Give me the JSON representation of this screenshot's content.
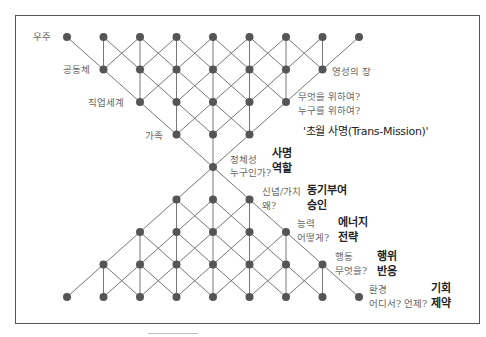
{
  "diagram": {
    "title": "'초월 사명(Trans-Mission)'",
    "top_labels": [
      {
        "id": "universe",
        "text": "우주"
      },
      {
        "id": "community",
        "text": "공동체"
      },
      {
        "id": "work-world",
        "text": "직업세계"
      },
      {
        "id": "family",
        "text": "가족"
      },
      {
        "id": "spiritual-field",
        "text": "영성의 장"
      }
    ],
    "purpose_question": [
      "무엇을 위하여?",
      "누구를 위하여?"
    ],
    "levels": [
      {
        "id": "identity",
        "label": "정체성",
        "question": "누구인가?",
        "keys": [
          "사명",
          "역할"
        ]
      },
      {
        "id": "beliefs",
        "label": "신념/가치",
        "question": "왜?",
        "keys": [
          "동기부여",
          "승인"
        ]
      },
      {
        "id": "capabilities",
        "label": "능력",
        "question": "어떻게?",
        "keys": [
          "에너지",
          "전략"
        ]
      },
      {
        "id": "behavior",
        "label": "행동",
        "question": "무엇을?",
        "keys": [
          "행위",
          "반응"
        ]
      },
      {
        "id": "environment",
        "label": "환경",
        "question": "어디서? 언제?",
        "keys": [
          "기회",
          "제약"
        ]
      }
    ],
    "lattice": {
      "col_x0": 67,
      "col_dx": 36.5,
      "row_y0": 37,
      "row_dy": 32.5,
      "rows": [
        [
          0,
          1,
          2,
          3,
          4,
          5,
          6,
          7,
          8
        ],
        [
          1,
          2,
          3,
          4,
          5,
          6,
          7
        ],
        [
          2,
          3,
          4,
          5,
          6
        ],
        [
          3,
          4,
          5
        ],
        [
          4
        ],
        [
          3,
          4,
          5
        ],
        [
          2,
          3,
          4,
          5,
          6
        ],
        [
          1,
          2,
          3,
          4,
          5,
          6,
          7
        ],
        [
          0,
          1,
          2,
          3,
          4,
          5,
          6,
          7,
          8
        ]
      ],
      "node_color": "#555555",
      "line_color": "#777777"
    }
  }
}
